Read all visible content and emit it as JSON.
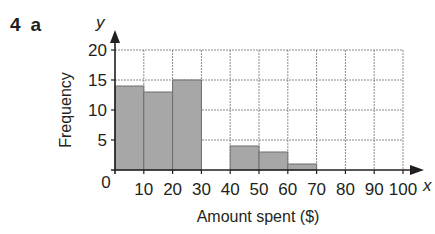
{
  "question": {
    "number": "4",
    "part": "a"
  },
  "chart_data": {
    "type": "bar",
    "subtype": "histogram",
    "title": "",
    "xlabel": "Amount spent ($)",
    "ylabel": "Frequency",
    "x_var": "x",
    "y_var": "y",
    "bins": [
      [
        0,
        10
      ],
      [
        10,
        20
      ],
      [
        20,
        30
      ],
      [
        30,
        40
      ],
      [
        40,
        50
      ],
      [
        50,
        60
      ],
      [
        60,
        70
      ],
      [
        70,
        80
      ],
      [
        80,
        90
      ],
      [
        90,
        100
      ]
    ],
    "categories": [
      "0-10",
      "10-20",
      "20-30",
      "30-40",
      "40-50",
      "50-60",
      "60-70",
      "70-80",
      "80-90",
      "90-100"
    ],
    "values": [
      14,
      13,
      15,
      0,
      4,
      3,
      1,
      0,
      0,
      0
    ],
    "xticks": [
      "0",
      "10",
      "20",
      "30",
      "40",
      "50",
      "60",
      "70",
      "80",
      "90",
      "100"
    ],
    "yticks": [
      "5",
      "10",
      "15",
      "20"
    ],
    "xlim": [
      0,
      100
    ],
    "ylim": [
      0,
      20
    ],
    "grid": true,
    "legend": null,
    "colors": {
      "bar": "#a7a7a7",
      "bar_edge": "#6e6e6e",
      "grid": "#8a8a8a",
      "axis": "#231f20"
    }
  }
}
